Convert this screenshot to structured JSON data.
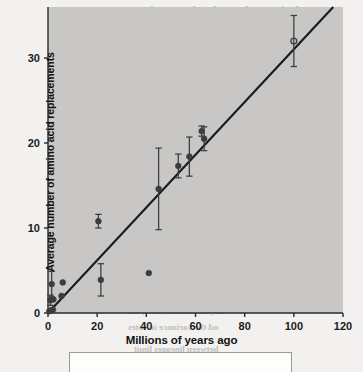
{
  "figure": {
    "axes": {
      "x": {
        "label": "Millions of years ago",
        "ticks": [
          0,
          20,
          40,
          60,
          80,
          100,
          120
        ],
        "min": 0,
        "max": 120
      },
      "y": {
        "label": "Average number of amino acid replacements",
        "ticks": [
          0,
          10,
          20,
          30
        ],
        "min": 0,
        "max": 36
      }
    },
    "plot_background_color": "#c8c7c5",
    "marker_color": "#3c3c3c",
    "line_color": "#1a1a1a",
    "caption_box_present": true,
    "caption_text": ""
  },
  "showthrough": {
    "lines": [
      {
        "text": "Evolution at the Molecular Level",
        "x": 150,
        "y": 4,
        "size": 12
      },
      {
        "text": "Variation with Several Genes",
        "x": 168,
        "y": 20,
        "size": 12
      },
      {
        "text": "is event involved",
        "x": 196,
        "y": 36,
        "size": 9
      },
      {
        "text": "ion might have been clarified",
        "x": 110,
        "y": 55,
        "size": 9
      },
      {
        "text": "nces than expected there is",
        "x": 120,
        "y": 70,
        "size": 9
      },
      {
        "text": "s of molecular clock estimates",
        "x": 108,
        "y": 85,
        "size": 9
      },
      {
        "text": "anges in divergence",
        "x": 150,
        "y": 100,
        "size": 9
      },
      {
        "text": "substitution rates for the",
        "x": 132,
        "y": 116,
        "size": 9
      },
      {
        "text": "s of sequence evolution have",
        "x": 112,
        "y": 132,
        "size": 9
      },
      {
        "text": "e gene when the divergence",
        "x": 118,
        "y": 148,
        "size": 9
      },
      {
        "text": "all of the proteins in a",
        "x": 140,
        "y": 164,
        "size": 9
      },
      {
        "text": "ne and were likely the",
        "x": 140,
        "y": 180,
        "size": 9
      },
      {
        "text": "e observed in the rate of",
        "x": 134,
        "y": 196,
        "size": 9
      },
      {
        "text": "ifferences the correlation",
        "x": 122,
        "y": 212,
        "size": 9
      },
      {
        "text": "quence divergence is strongest",
        "x": 106,
        "y": 228,
        "size": 9
      },
      {
        "text": "mes. The molecular clock",
        "x": 126,
        "y": 244,
        "size": 9
      },
      {
        "text": "imate of branching times",
        "x": 130,
        "y": 260,
        "size": 9
      },
      {
        "text": "used to date the",
        "x": 150,
        "y": 290,
        "size": 9
      },
      {
        "text": "ary events. However, the",
        "x": 128,
        "y": 306,
        "size": 9
      },
      {
        "text": "nd the variance in rates",
        "x": 128,
        "y": 322,
        "size": 9
      },
      {
        "text": "between lineages limit",
        "x": 134,
        "y": 344,
        "size": 9
      }
    ]
  },
  "chart_data": {
    "type": "scatter",
    "title": "",
    "subtitle": "",
    "xlabel": "Millions of years ago",
    "ylabel": "Average number of amino acid replacements",
    "xlim": [
      0,
      120
    ],
    "ylim": [
      0,
      36
    ],
    "xticks": [
      0,
      20,
      40,
      60,
      80,
      100,
      120
    ],
    "yticks": [
      0,
      10,
      20,
      30
    ],
    "grid": false,
    "legend": null,
    "points": [
      {
        "x": 0.5,
        "y": 0.2,
        "yerr": 0.0,
        "filled": true
      },
      {
        "x": 1.2,
        "y": 0.3,
        "yerr": 0.0,
        "filled": true
      },
      {
        "x": 2.0,
        "y": 0.4,
        "yerr": 0.0,
        "filled": true
      },
      {
        "x": 1.0,
        "y": 1.5,
        "yerr": 0.6,
        "filled": true
      },
      {
        "x": 2.2,
        "y": 1.6,
        "yerr": 0.0,
        "filled": true
      },
      {
        "x": 1.5,
        "y": 3.4,
        "yerr": 1.5,
        "filled": true
      },
      {
        "x": 5.5,
        "y": 2.0,
        "yerr": 0.0,
        "filled": true
      },
      {
        "x": 6.0,
        "y": 3.6,
        "yerr": 0.0,
        "filled": true
      },
      {
        "x": 20.5,
        "y": 10.8,
        "yerr": 0.8,
        "filled": true
      },
      {
        "x": 21.5,
        "y": 3.9,
        "yerr": 1.9,
        "filled": true
      },
      {
        "x": 41.0,
        "y": 4.7,
        "yerr": 0.0,
        "filled": true
      },
      {
        "x": 45.0,
        "y": 14.6,
        "yerr": 4.8,
        "filled": true
      },
      {
        "x": 53.0,
        "y": 17.3,
        "yerr": 1.4,
        "filled": true
      },
      {
        "x": 57.5,
        "y": 18.4,
        "yerr": 2.3,
        "filled": true
      },
      {
        "x": 62.5,
        "y": 21.4,
        "yerr": 0.6,
        "filled": true
      },
      {
        "x": 63.5,
        "y": 20.5,
        "yerr": 1.4,
        "filled": true
      },
      {
        "x": 100.0,
        "y": 32.0,
        "yerr": 3.0,
        "filled": false
      }
    ],
    "fit_line": {
      "type": "linear",
      "x_start": 0,
      "y_start": 0,
      "x_end": 117,
      "y_end": 36.3
    }
  }
}
